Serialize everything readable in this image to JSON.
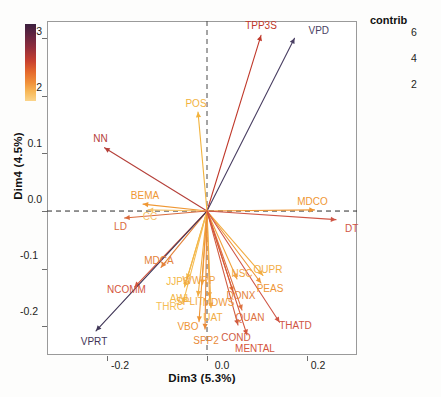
{
  "chart_data": {
    "type": "scatter",
    "title": "",
    "xlabel": "Dim3 (5.3%)",
    "ylabel": "Dim4 (4.5%)",
    "xlim": [
      -0.32,
      0.3
    ],
    "ylim": [
      -0.25,
      0.33
    ],
    "xticks": [
      "-0.2",
      "0.0",
      "0.2"
    ],
    "xtick_values": [
      -0.2,
      0.0,
      0.2
    ],
    "yticks": [
      "0.3",
      "0.2",
      "0.1",
      "0.0",
      "-0.1",
      "-0.2"
    ],
    "ytick_values": [
      0.3,
      0.2,
      0.1,
      0.0,
      -0.1,
      -0.2
    ],
    "grid": false,
    "reference_lines": [
      "x=0 dashed",
      "y=0 dashed"
    ],
    "legend": {
      "title": "contrib",
      "position": "right",
      "ticks": [
        "6",
        "4",
        "2"
      ],
      "tick_values": [
        6,
        4,
        2
      ],
      "colors_low_to_high": [
        "#fbd48a",
        "#f7b858",
        "#f0903a",
        "#e4682c",
        "#c7402f",
        "#8f2d3c",
        "#3b1f3e"
      ]
    },
    "origin": [
      0.0,
      0.0
    ],
    "arrows": [
      {
        "label": "TPP3S",
        "x": 0.108,
        "y": 0.305,
        "contrib": 5.2,
        "color": "#c0392b"
      },
      {
        "label": "VPD",
        "x": 0.175,
        "y": 0.3,
        "contrib": 6.6,
        "color": "#4a3f63"
      },
      {
        "label": "POS",
        "x": -0.018,
        "y": 0.172,
        "contrib": 2.2,
        "color": "#f2b33d"
      },
      {
        "label": "NN",
        "x": -0.205,
        "y": 0.11,
        "contrib": 5.0,
        "color": "#b5403a"
      },
      {
        "label": "MDCO",
        "x": 0.215,
        "y": 0.002,
        "contrib": 2.6,
        "color": "#ef9733"
      },
      {
        "label": "DT",
        "x": 0.258,
        "y": -0.015,
        "contrib": 4.4,
        "color": "#cf5545"
      },
      {
        "label": "BEMA",
        "x": -0.128,
        "y": 0.012,
        "contrib": 2.6,
        "color": "#ef9733"
      },
      {
        "label": "CC",
        "x": -0.118,
        "y": 0.002,
        "contrib": 2.0,
        "color": "#f6c36a"
      },
      {
        "label": "LD",
        "x": -0.165,
        "y": -0.012,
        "contrib": 3.8,
        "color": "#d96b3c"
      },
      {
        "label": "MDCA",
        "x": -0.092,
        "y": -0.098,
        "contrib": 3.2,
        "color": "#e4823a"
      },
      {
        "label": "NCOMM",
        "x": -0.145,
        "y": -0.132,
        "contrib": 4.0,
        "color": "#d4553c"
      },
      {
        "label": "JJPS",
        "x": -0.04,
        "y": -0.118,
        "contrib": 2.2,
        "color": "#f3b748"
      },
      {
        "label": "AWL",
        "x": -0.045,
        "y": -0.132,
        "contrib": 2.2,
        "color": "#f3b748"
      },
      {
        "label": "VPRT",
        "x": -0.222,
        "y": -0.208,
        "contrib": 6.8,
        "color": "#3f3556"
      },
      {
        "label": "THRC",
        "x": -0.048,
        "y": -0.16,
        "contrib": 2.1,
        "color": "#f5bd55"
      },
      {
        "label": "SPLIT",
        "x": -0.018,
        "y": -0.148,
        "contrib": 2.3,
        "color": "#f2ad44"
      },
      {
        "label": "WWRP",
        "x": -0.01,
        "y": -0.128,
        "contrib": 2.4,
        "color": "#f0a33e"
      },
      {
        "label": "MDWS",
        "x": 0.005,
        "y": -0.15,
        "contrib": 2.5,
        "color": "#ef9b3b"
      },
      {
        "label": "UAT",
        "x": 0.008,
        "y": -0.168,
        "contrib": 2.3,
        "color": "#f2ad44"
      },
      {
        "label": "VBO",
        "x": -0.016,
        "y": -0.192,
        "contrib": 2.6,
        "color": "#ee9536"
      },
      {
        "label": "SPP2",
        "x": -0.004,
        "y": -0.205,
        "contrib": 3.0,
        "color": "#e98a39"
      },
      {
        "label": "NSC",
        "x": 0.06,
        "y": -0.118,
        "contrib": 2.4,
        "color": "#f0a33e"
      },
      {
        "label": "DONX",
        "x": 0.052,
        "y": -0.14,
        "contrib": 3.2,
        "color": "#e4823a"
      },
      {
        "label": "OUPR",
        "x": 0.112,
        "y": -0.112,
        "contrib": 2.3,
        "color": "#f2ad44"
      },
      {
        "label": "PEAS",
        "x": 0.108,
        "y": -0.125,
        "contrib": 2.6,
        "color": "#ee9536"
      },
      {
        "label": "QUAN",
        "x": 0.07,
        "y": -0.172,
        "contrib": 3.6,
        "color": "#dd7140"
      },
      {
        "label": "COND",
        "x": 0.062,
        "y": -0.198,
        "contrib": 4.2,
        "color": "#d05b42"
      },
      {
        "label": "MENTAL",
        "x": 0.08,
        "y": -0.215,
        "contrib": 4.0,
        "color": "#d4553c"
      },
      {
        "label": "THATD",
        "x": 0.145,
        "y": -0.193,
        "contrib": 4.4,
        "color": "#cf5545"
      }
    ]
  },
  "axes": {
    "x_title": "Dim3 (5.3%)",
    "y_title": "Dim4 (4.5%)"
  },
  "legend": {
    "title": "contrib",
    "t6": "6",
    "t4": "4",
    "t2": "2"
  }
}
